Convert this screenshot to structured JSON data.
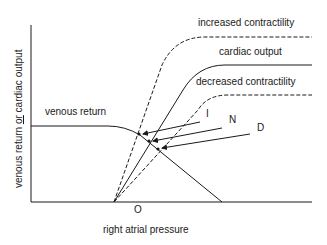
{
  "diagram": {
    "y_axis_label_parts": [
      "venous return ",
      "or",
      " cardiac output"
    ],
    "x_axis_label": "right atrial pressure",
    "origin_label": "O",
    "curves": {
      "increased": "increased contractility",
      "normal": "cardiac output",
      "decreased": "decreased contractility",
      "venous": "venous return"
    },
    "points": {
      "I": "I",
      "N": "N",
      "D": "D"
    },
    "colors": {
      "ink": "#1a1a1a",
      "background": "#ffffff"
    }
  }
}
